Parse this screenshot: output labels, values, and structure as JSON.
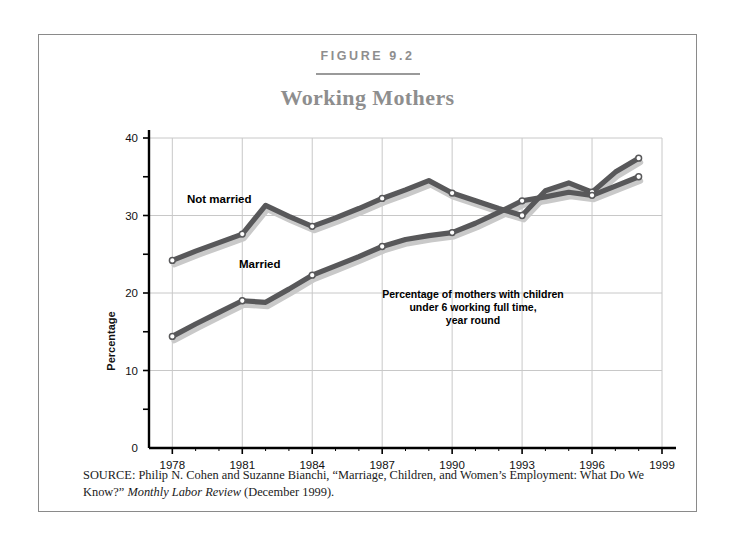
{
  "figure": {
    "number_label": "FIGURE 9.2",
    "title": "Working Mothers",
    "source_prefix": "SOURCE:",
    "source_text_1": " Philip N. Cohen and Suzanne Bianchi, “Marriage, Children, and Women’s Employment: What Do We Know?” ",
    "source_italic": "Monthly Labor Review",
    "source_text_2": " (December 1999)."
  },
  "annotation": {
    "line1": "Percentage of mothers with children",
    "line2": "under 6 working full time,",
    "line3": "year round"
  },
  "colors": {
    "line_dark": "#58585a",
    "line_shadow": "#c9c9c9",
    "marker_fill": "#ffffff",
    "grid": "#c8c8c8",
    "axis": "#000000",
    "title_gray": "#8e8e8e",
    "frame": "#8a8a8a"
  },
  "chart_data": {
    "type": "line",
    "title": "Working Mothers",
    "subtitle": "Percentage of mothers with children under 6 working full time, year round",
    "xlabel": "",
    "ylabel": "Percentage",
    "xlim": [
      1977,
      1999
    ],
    "ylim": [
      0,
      40
    ],
    "yticks": [
      0,
      10,
      20,
      30,
      40
    ],
    "yminorticks": [
      5,
      15,
      25,
      35
    ],
    "xticks": [
      1978,
      1981,
      1984,
      1987,
      1990,
      1993,
      1996,
      1999
    ],
    "xticklabels": [
      "1978",
      "1981",
      "1984",
      "1987",
      "1990",
      "1993",
      "1996",
      "1999"
    ],
    "grid": true,
    "legend": "inline-labels",
    "x": [
      1978,
      1979,
      1980,
      1981,
      1982,
      1983,
      1984,
      1985,
      1986,
      1987,
      1988,
      1989,
      1990,
      1991,
      1992,
      1993,
      1994,
      1995,
      1996,
      1997,
      1998
    ],
    "series": [
      {
        "name": "Not married",
        "label": "Not married",
        "values": [
          24.2,
          25.4,
          26.5,
          27.6,
          31.3,
          29.9,
          28.6,
          29.7,
          30.9,
          32.2,
          33.3,
          34.5,
          32.9,
          31.9,
          30.9,
          30.0,
          33.2,
          34.2,
          33.0,
          35.6,
          37.4
        ]
      },
      {
        "name": "Married",
        "label": "Married",
        "values": [
          14.4,
          16.0,
          17.5,
          19.0,
          18.8,
          20.5,
          22.3,
          23.5,
          24.7,
          26.0,
          26.9,
          27.4,
          27.8,
          29.0,
          30.4,
          31.9,
          32.4,
          33.0,
          32.6,
          33.8,
          35.0
        ]
      }
    ]
  }
}
